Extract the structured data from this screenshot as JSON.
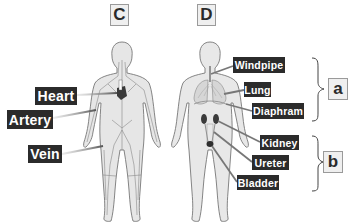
{
  "figures": [
    {
      "id": "C",
      "label": "C",
      "system": "circulatory",
      "callouts": [
        {
          "text": "Heart"
        },
        {
          "text": "Artery"
        },
        {
          "text": "Vein"
        }
      ]
    },
    {
      "id": "D",
      "label": "D",
      "system": "respiratory-and-urinary",
      "callouts": [
        {
          "text": "Windpipe"
        },
        {
          "text": "Lung"
        },
        {
          "text": "Diaphram"
        },
        {
          "text": "Kidney"
        },
        {
          "text": "Ureter"
        },
        {
          "text": "Bladder"
        }
      ]
    }
  ],
  "groups": [
    {
      "label": "a",
      "members": [
        "Windpipe",
        "Lung",
        "Diaphram"
      ]
    },
    {
      "label": "b",
      "members": [
        "Kidney",
        "Ureter",
        "Bladder"
      ]
    }
  ],
  "colors": {
    "label_bg": "#2b2b2b",
    "label_text": "#ffffff",
    "body_fill": "#e6e6e6",
    "body_outline": "#777777",
    "box_bg": "#efefef",
    "box_border": "#9a9a9a"
  }
}
